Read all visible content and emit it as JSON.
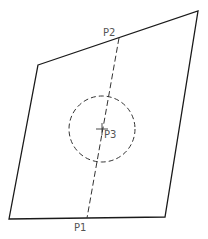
{
  "diagram": {
    "type": "geometric-construction",
    "colors": {
      "stroke": "#1a1a1a",
      "dashed": "#333333",
      "label": "#555555",
      "background": "#ffffff"
    },
    "quadrilateral": {
      "points": [
        [
          38,
          65
        ],
        [
          198,
          11
        ],
        [
          165,
          217
        ],
        [
          9,
          219
        ]
      ]
    },
    "dashed_line": {
      "from": "P2",
      "to": "P1"
    },
    "circle": {
      "center_label": "P3",
      "cx": 102,
      "cy": 129,
      "r": 33,
      "style": "dashed"
    },
    "points": {
      "p1": {
        "label": "P1",
        "x": 87,
        "y": 218
      },
      "p2": {
        "label": "P2",
        "x": 119,
        "y": 38
      },
      "p3": {
        "label": "P3",
        "x": 102,
        "y": 129
      }
    }
  }
}
